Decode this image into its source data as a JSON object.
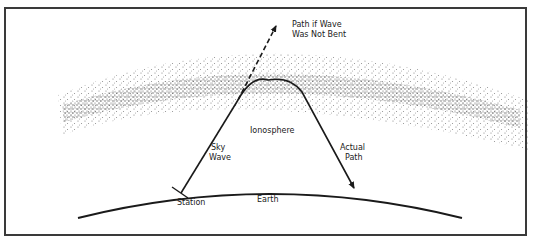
{
  "diagram": {
    "labels": {
      "unbent_path_line1": "Path if Wave",
      "unbent_path_line2": "Was Not Bent",
      "ionosphere": "Ionosphere",
      "sky_wave_line1": "Sky",
      "sky_wave_line2": "Wave",
      "actual_path_line1": "Actual",
      "actual_path_line2": "Path",
      "station": "Station",
      "earth": "Earth"
    },
    "colors": {
      "line": "#1a1a1a",
      "stipple": "#555555",
      "frame": "#3a3a3a"
    }
  }
}
